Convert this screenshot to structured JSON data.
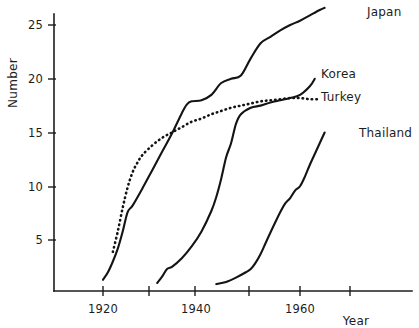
{
  "chart_data": {
    "type": "line",
    "title": "",
    "xlabel": "Year",
    "ylabel": "Number",
    "xlim": [
      1910,
      1968
    ],
    "ylim": [
      0,
      27
    ],
    "grid": false,
    "legend_position": "right-inline-labels",
    "x_ticks": [
      1920,
      1940,
      1960
    ],
    "x_tick_labels": [
      "1920",
      "1940",
      "1960"
    ],
    "x_minor_ticks": [
      1930,
      1950,
      1965
    ],
    "y_ticks": [
      5,
      10,
      15,
      20,
      25
    ],
    "y_tick_labels": [
      "5",
      "10",
      "15",
      "20",
      "25"
    ],
    "series": [
      {
        "name": "Japan",
        "style": "solid",
        "label": "Japan",
        "x": [
          1920,
          1921,
          1922,
          1923,
          1924,
          1925,
          1926,
          1928,
          1930,
          1932,
          1934,
          1936,
          1937,
          1938,
          1940,
          1942,
          1944,
          1946,
          1948,
          1950,
          1952,
          1954,
          1956,
          1958,
          1960,
          1962,
          1964,
          1965
        ],
        "y": [
          1.3,
          2.0,
          3.0,
          4.2,
          5.8,
          7.6,
          8.2,
          9.8,
          11.5,
          13.2,
          14.9,
          16.8,
          17.6,
          17.9,
          18.0,
          18.5,
          19.6,
          20.0,
          20.3,
          21.9,
          23.3,
          23.9,
          24.5,
          25.0,
          25.4,
          25.9,
          26.4,
          26.6
        ]
      },
      {
        "name": "Turkey",
        "style": "dotted",
        "label": "Turkey",
        "x": [
          1922,
          1923,
          1924,
          1925,
          1926,
          1927,
          1928,
          1930,
          1932,
          1934,
          1936,
          1938,
          1940,
          1942,
          1944,
          1946,
          1948,
          1950,
          1952,
          1954,
          1956,
          1958,
          1960,
          1962,
          1964
        ],
        "y": [
          3.9,
          5.8,
          8.0,
          9.9,
          11.3,
          12.2,
          12.9,
          13.8,
          14.5,
          15.0,
          15.5,
          16.0,
          16.3,
          16.7,
          17.0,
          17.3,
          17.5,
          17.7,
          17.9,
          18.0,
          18.1,
          18.2,
          18.2,
          18.1,
          18.1
        ]
      },
      {
        "name": "Korea",
        "style": "solid",
        "label": "Korea",
        "x": [
          1931,
          1932,
          1933,
          1934,
          1936,
          1938,
          1940,
          1942,
          1943,
          1944,
          1945,
          1946,
          1947,
          1948,
          1950,
          1952,
          1954,
          1956,
          1958,
          1960,
          1962,
          1963
        ],
        "y": [
          1.0,
          1.6,
          2.3,
          2.5,
          3.3,
          4.4,
          5.8,
          7.7,
          9.0,
          10.7,
          12.7,
          14.0,
          15.8,
          16.7,
          17.3,
          17.5,
          17.8,
          18.0,
          18.2,
          18.5,
          19.3,
          20.0
        ]
      },
      {
        "name": "Thailand",
        "style": "solid",
        "label": "Thailand",
        "x": [
          1943,
          1945,
          1947,
          1949,
          1950,
          1951,
          1952,
          1953,
          1954,
          1956,
          1957,
          1958,
          1959,
          1960,
          1961,
          1962,
          1963,
          1964,
          1965
        ],
        "y": [
          0.9,
          1.1,
          1.5,
          2.0,
          2.3,
          2.9,
          3.7,
          4.7,
          5.7,
          7.6,
          8.4,
          8.9,
          9.6,
          10.0,
          10.9,
          12.0,
          13.0,
          14.0,
          15.0
        ]
      }
    ]
  },
  "labels": {
    "japan": "Japan",
    "korea": "Korea",
    "turkey": "Turkey",
    "thailand": "Thailand",
    "y_axis_title": "Number",
    "x_axis_title": "Year",
    "y_tick_25": "25",
    "y_tick_20": "20",
    "y_tick_15": "15",
    "y_tick_10": "10",
    "y_tick_5": "5",
    "x_tick_1920": "1920",
    "x_tick_1940": "1940",
    "x_tick_1960": "1960"
  },
  "colors": {
    "ink": "#141414",
    "background": "#ffffff"
  }
}
